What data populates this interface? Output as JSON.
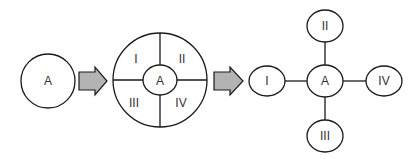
{
  "diagram": {
    "stage1": {
      "center_label": "A"
    },
    "arrows": [
      {
        "color": "#b3b3b3"
      },
      {
        "color": "#b3b3b3"
      }
    ],
    "stage2": {
      "center_label": "A",
      "quadrants": [
        "I",
        "II",
        "III",
        "IV"
      ]
    },
    "stage3": {
      "center_label": "A",
      "nodes": {
        "left": "I",
        "top": "II",
        "bottom": "III",
        "right": "IV"
      }
    }
  }
}
